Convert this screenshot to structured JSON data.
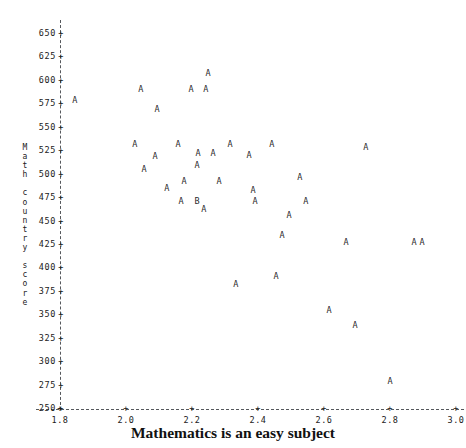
{
  "chart_data": {
    "type": "scatter",
    "title": "",
    "xlabel": "Mathematics is an easy subject",
    "ylabel": "Math country score",
    "ylabel_stacked": "M\na\nt\nh\n\nc\no\nu\nn\nt\nr\ny\n\ns\nc\no\nr\ne",
    "xlim": [
      1.8,
      3.0
    ],
    "ylim": [
      250,
      650
    ],
    "xticks": [
      "1.8",
      "2.0",
      "2.2",
      "2.4",
      "2.6",
      "2.8",
      "3.0"
    ],
    "xtick_values": [
      1.8,
      2.0,
      2.2,
      2.4,
      2.6,
      2.8,
      3.0
    ],
    "yticks": [
      "650",
      "625",
      "600",
      "575",
      "550",
      "525",
      "500",
      "475",
      "450",
      "425",
      "400",
      "375",
      "350",
      "325",
      "300",
      "275",
      "250"
    ],
    "ytick_values": [
      650,
      625,
      600,
      575,
      550,
      525,
      500,
      475,
      450,
      425,
      400,
      375,
      350,
      325,
      300,
      275,
      250
    ],
    "tick_mark_glyph": "+",
    "grid": false,
    "legend": null,
    "axis_style": "dashed",
    "marker_labels": [
      "A",
      "B"
    ],
    "points": [
      {
        "x": 1.845,
        "y": 577,
        "label": "A"
      },
      {
        "x": 2.249,
        "y": 606,
        "label": "A"
      },
      {
        "x": 2.045,
        "y": 589,
        "label": "A"
      },
      {
        "x": 2.197,
        "y": 589,
        "label": "A"
      },
      {
        "x": 2.242,
        "y": 589,
        "label": "A"
      },
      {
        "x": 2.094,
        "y": 568,
        "label": "A"
      },
      {
        "x": 2.027,
        "y": 531,
        "label": "A"
      },
      {
        "x": 2.158,
        "y": 531,
        "label": "A"
      },
      {
        "x": 2.315,
        "y": 531,
        "label": "A"
      },
      {
        "x": 2.442,
        "y": 531,
        "label": "A"
      },
      {
        "x": 2.727,
        "y": 527,
        "label": "A"
      },
      {
        "x": 2.088,
        "y": 518,
        "label": "A"
      },
      {
        "x": 2.218,
        "y": 521,
        "label": "A"
      },
      {
        "x": 2.264,
        "y": 521,
        "label": "A"
      },
      {
        "x": 2.373,
        "y": 519,
        "label": "A"
      },
      {
        "x": 2.055,
        "y": 504,
        "label": "A"
      },
      {
        "x": 2.215,
        "y": 508,
        "label": "A"
      },
      {
        "x": 2.176,
        "y": 491,
        "label": "A"
      },
      {
        "x": 2.282,
        "y": 491,
        "label": "A"
      },
      {
        "x": 2.527,
        "y": 495,
        "label": "A"
      },
      {
        "x": 2.124,
        "y": 484,
        "label": "A"
      },
      {
        "x": 2.385,
        "y": 481,
        "label": "A"
      },
      {
        "x": 2.167,
        "y": 470,
        "label": "A"
      },
      {
        "x": 2.215,
        "y": 470,
        "label": "B"
      },
      {
        "x": 2.391,
        "y": 470,
        "label": "A"
      },
      {
        "x": 2.545,
        "y": 470,
        "label": "A"
      },
      {
        "x": 2.236,
        "y": 461,
        "label": "A"
      },
      {
        "x": 2.494,
        "y": 455,
        "label": "A"
      },
      {
        "x": 2.473,
        "y": 433,
        "label": "A"
      },
      {
        "x": 2.667,
        "y": 426,
        "label": "A"
      },
      {
        "x": 2.873,
        "y": 426,
        "label": "A"
      },
      {
        "x": 2.897,
        "y": 426,
        "label": "A"
      },
      {
        "x": 2.455,
        "y": 390,
        "label": "A"
      },
      {
        "x": 2.333,
        "y": 381,
        "label": "A"
      },
      {
        "x": 2.615,
        "y": 353,
        "label": "A"
      },
      {
        "x": 2.694,
        "y": 337,
        "label": "A"
      },
      {
        "x": 2.8,
        "y": 278,
        "label": "A"
      }
    ]
  }
}
